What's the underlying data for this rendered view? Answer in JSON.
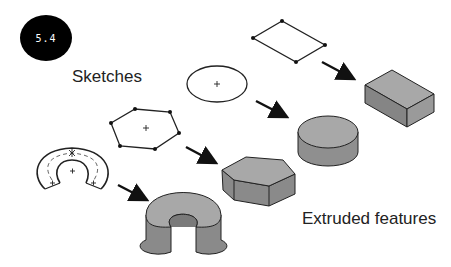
{
  "figure": {
    "badge": "5.4",
    "labels": {
      "sketches": "Sketches",
      "extruded": "Extruded features"
    },
    "colors": {
      "top_face": "#a8a8a8",
      "side_face": "#8a8a8a",
      "dark_face": "#6e6e6e",
      "outline": "#222222",
      "arrow": "#111111"
    },
    "pairs": [
      {
        "sketch": "rectangle-sketch",
        "feature": "rectangular-block"
      },
      {
        "sketch": "circle-sketch",
        "feature": "cylinder"
      },
      {
        "sketch": "hexagon-sketch",
        "feature": "hexagonal-prism"
      },
      {
        "sketch": "c-shape-sketch",
        "feature": "c-shaped-extrusion"
      }
    ]
  }
}
